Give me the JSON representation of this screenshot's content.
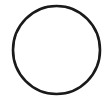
{
  "canvas": {
    "width": 110,
    "height": 103,
    "background_color": "#ffffff",
    "description": "circle-outline-drawing"
  },
  "figure": {
    "name": "circle",
    "type": "circle-outline",
    "label": "Circle",
    "fill": "none",
    "fill_color": "#ffffff",
    "stroke_color": "#1a1a1a",
    "stroke_width": 2.6,
    "center_x": 56.5,
    "center_y": 50.0,
    "radius_x": 43.5,
    "radius_y": 44.0,
    "bounds": {
      "left": 13,
      "top": 6,
      "right": 100,
      "bottom": 94
    }
  }
}
